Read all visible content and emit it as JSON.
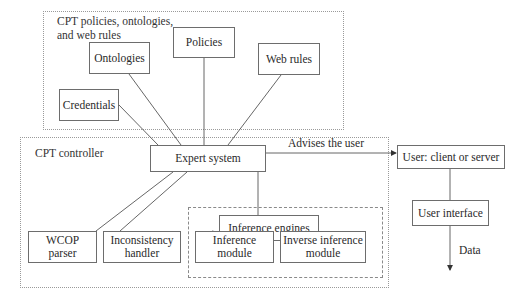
{
  "groups": {
    "policies_group": {
      "label_line1": "CPT policies, ontologies,",
      "label_line2": "and web rules"
    },
    "controller_group": {
      "label": "CPT controller"
    },
    "inference_group": {
      "label": ""
    }
  },
  "nodes": {
    "ontologies": "Ontologies",
    "policies": "Policies",
    "web_rules": "Web rules",
    "credentials": "Credentials",
    "expert_system": "Expert system",
    "user": "User: client or server",
    "user_interface": "User interface",
    "inference_engines": "Inference engines",
    "wcop_parser_l1": "WCOP",
    "wcop_parser_l2": "parser",
    "inconsistency_l1": "Inconsistency",
    "inconsistency_l2": "handler",
    "inference_module_l1": "Inference",
    "inference_module_l2": "module",
    "inverse_inference_l1": "Inverse inference",
    "inverse_inference_l2": "module"
  },
  "edges": {
    "advises": "Advises the user",
    "data": "Data"
  },
  "colors": {
    "line": "#555555",
    "border": "#6d6d6d",
    "group_border": "#9a9a9a"
  }
}
